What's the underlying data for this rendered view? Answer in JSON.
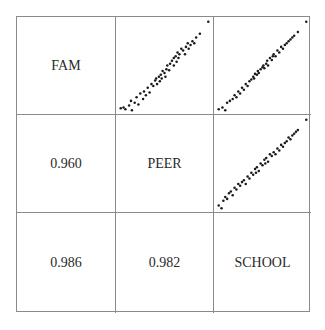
{
  "chart_data": {
    "type": "scatter",
    "title": "",
    "layout": "scatterplot-matrix",
    "variables": [
      "FAM",
      "PEER",
      "SCHOOL"
    ],
    "diagonal_labels": [
      "FAM",
      "PEER",
      "SCHOOL"
    ],
    "lower_triangle_correlations": [
      {
        "row": "PEER",
        "col": "FAM",
        "value": "0.960"
      },
      {
        "row": "SCHOOL",
        "col": "FAM",
        "value": "0.986"
      },
      {
        "row": "SCHOOL",
        "col": "PEER",
        "value": "0.982"
      }
    ],
    "upper_triangle_scatterplots": [
      {
        "x": "PEER",
        "y": "FAM",
        "position": "row1-col2",
        "points": [
          [
            0.03,
            0.04
          ],
          [
            0.06,
            0.05
          ],
          [
            0.08,
            0.03
          ],
          [
            0.12,
            0.07
          ],
          [
            0.15,
            0.02
          ],
          [
            0.14,
            0.12
          ],
          [
            0.18,
            0.1
          ],
          [
            0.2,
            0.16
          ],
          [
            0.22,
            0.08
          ],
          [
            0.24,
            0.2
          ],
          [
            0.27,
            0.14
          ],
          [
            0.28,
            0.22
          ],
          [
            0.3,
            0.18
          ],
          [
            0.32,
            0.26
          ],
          [
            0.34,
            0.21
          ],
          [
            0.36,
            0.3
          ],
          [
            0.38,
            0.28
          ],
          [
            0.4,
            0.34
          ],
          [
            0.41,
            0.36
          ],
          [
            0.42,
            0.3
          ],
          [
            0.44,
            0.38
          ],
          [
            0.45,
            0.33
          ],
          [
            0.46,
            0.4
          ],
          [
            0.47,
            0.36
          ],
          [
            0.48,
            0.44
          ],
          [
            0.5,
            0.42
          ],
          [
            0.51,
            0.38
          ],
          [
            0.52,
            0.46
          ],
          [
            0.53,
            0.5
          ],
          [
            0.55,
            0.45
          ],
          [
            0.56,
            0.52
          ],
          [
            0.58,
            0.55
          ],
          [
            0.6,
            0.5
          ],
          [
            0.6,
            0.58
          ],
          [
            0.62,
            0.6
          ],
          [
            0.63,
            0.54
          ],
          [
            0.64,
            0.64
          ],
          [
            0.65,
            0.58
          ],
          [
            0.66,
            0.62
          ],
          [
            0.68,
            0.68
          ],
          [
            0.7,
            0.66
          ],
          [
            0.72,
            0.62
          ],
          [
            0.73,
            0.7
          ],
          [
            0.75,
            0.74
          ],
          [
            0.76,
            0.68
          ],
          [
            0.78,
            0.72
          ],
          [
            0.8,
            0.76
          ],
          [
            0.82,
            0.74
          ],
          [
            0.84,
            0.8
          ],
          [
            0.88,
            0.84
          ],
          [
            0.97,
            0.97
          ]
        ]
      },
      {
        "x": "SCHOOL",
        "y": "FAM",
        "position": "row1-col3",
        "points": [
          [
            0.03,
            0.03
          ],
          [
            0.07,
            0.05
          ],
          [
            0.1,
            0.02
          ],
          [
            0.12,
            0.1
          ],
          [
            0.15,
            0.12
          ],
          [
            0.18,
            0.14
          ],
          [
            0.2,
            0.18
          ],
          [
            0.22,
            0.16
          ],
          [
            0.24,
            0.22
          ],
          [
            0.26,
            0.2
          ],
          [
            0.28,
            0.26
          ],
          [
            0.3,
            0.24
          ],
          [
            0.32,
            0.3
          ],
          [
            0.34,
            0.28
          ],
          [
            0.36,
            0.33
          ],
          [
            0.38,
            0.35
          ],
          [
            0.4,
            0.38
          ],
          [
            0.41,
            0.36
          ],
          [
            0.42,
            0.41
          ],
          [
            0.44,
            0.4
          ],
          [
            0.45,
            0.44
          ],
          [
            0.46,
            0.42
          ],
          [
            0.48,
            0.46
          ],
          [
            0.5,
            0.48
          ],
          [
            0.51,
            0.5
          ],
          [
            0.52,
            0.47
          ],
          [
            0.54,
            0.52
          ],
          [
            0.55,
            0.55
          ],
          [
            0.56,
            0.5
          ],
          [
            0.58,
            0.58
          ],
          [
            0.6,
            0.56
          ],
          [
            0.61,
            0.6
          ],
          [
            0.62,
            0.62
          ],
          [
            0.64,
            0.6
          ],
          [
            0.66,
            0.66
          ],
          [
            0.68,
            0.64
          ],
          [
            0.7,
            0.7
          ],
          [
            0.72,
            0.68
          ],
          [
            0.74,
            0.72
          ],
          [
            0.76,
            0.74
          ],
          [
            0.78,
            0.76
          ],
          [
            0.8,
            0.78
          ],
          [
            0.82,
            0.8
          ],
          [
            0.84,
            0.82
          ],
          [
            0.88,
            0.86
          ],
          [
            0.97,
            0.97
          ]
        ]
      },
      {
        "x": "SCHOOL",
        "y": "PEER",
        "position": "row2-col3",
        "points": [
          [
            0.03,
            0.05
          ],
          [
            0.06,
            0.02
          ],
          [
            0.08,
            0.1
          ],
          [
            0.1,
            0.14
          ],
          [
            0.12,
            0.12
          ],
          [
            0.14,
            0.18
          ],
          [
            0.16,
            0.2
          ],
          [
            0.18,
            0.16
          ],
          [
            0.2,
            0.24
          ],
          [
            0.22,
            0.22
          ],
          [
            0.24,
            0.28
          ],
          [
            0.26,
            0.26
          ],
          [
            0.28,
            0.3
          ],
          [
            0.3,
            0.32
          ],
          [
            0.32,
            0.28
          ],
          [
            0.34,
            0.36
          ],
          [
            0.36,
            0.34
          ],
          [
            0.38,
            0.4
          ],
          [
            0.4,
            0.38
          ],
          [
            0.42,
            0.44
          ],
          [
            0.43,
            0.4
          ],
          [
            0.44,
            0.46
          ],
          [
            0.46,
            0.42
          ],
          [
            0.48,
            0.5
          ],
          [
            0.5,
            0.48
          ],
          [
            0.52,
            0.54
          ],
          [
            0.53,
            0.5
          ],
          [
            0.54,
            0.56
          ],
          [
            0.56,
            0.52
          ],
          [
            0.58,
            0.6
          ],
          [
            0.6,
            0.58
          ],
          [
            0.62,
            0.62
          ],
          [
            0.64,
            0.6
          ],
          [
            0.66,
            0.66
          ],
          [
            0.68,
            0.64
          ],
          [
            0.7,
            0.7
          ],
          [
            0.72,
            0.68
          ],
          [
            0.74,
            0.72
          ],
          [
            0.76,
            0.74
          ],
          [
            0.78,
            0.78
          ],
          [
            0.8,
            0.76
          ],
          [
            0.82,
            0.8
          ],
          [
            0.84,
            0.82
          ],
          [
            0.86,
            0.84
          ],
          [
            0.88,
            0.86
          ],
          [
            0.97,
            0.97
          ]
        ]
      }
    ],
    "xlabel": "",
    "ylabel": "",
    "grid": true,
    "legend": null
  }
}
